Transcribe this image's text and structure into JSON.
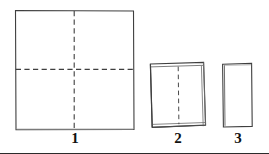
{
  "diagram": {
    "background_color": "#ffffff",
    "stroke_color": "#3a3a3a",
    "label_color": "#111111",
    "steps": [
      {
        "label": "1",
        "name": "unfolded-square-sheet",
        "description": "Full square sheet with horizontal and vertical dashed fold lines forming a cross",
        "shape": "square",
        "fold_lines": [
          "vertical-center-dashed",
          "horizontal-center-dashed"
        ],
        "bounds": {
          "x": 15,
          "y": 10,
          "width": 119,
          "height": 120
        }
      },
      {
        "label": "2",
        "name": "half-folded-sheet",
        "description": "Sheet folded once along the horizontal line; doubled edges visible at top, right and bottom; vertical dashed fold line remains",
        "shape": "square-folded",
        "fold_lines": [
          "vertical-center-dashed"
        ],
        "bounds": {
          "x": 150,
          "y": 62,
          "width": 56,
          "height": 66
        }
      },
      {
        "label": "3",
        "name": "quarter-folded-sheet",
        "description": "Sheet folded twice into a small upright rectangle; no fold lines remain visible",
        "shape": "rectangle",
        "fold_lines": [],
        "bounds": {
          "x": 222,
          "y": 63,
          "width": 30,
          "height": 64
        }
      }
    ]
  }
}
